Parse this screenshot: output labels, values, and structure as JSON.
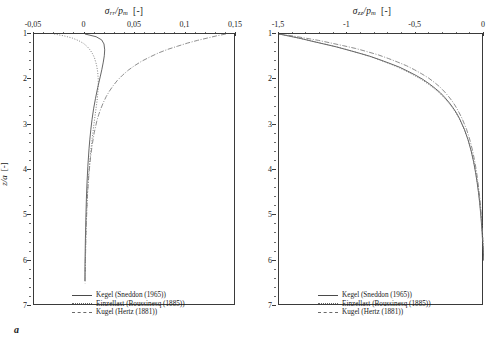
{
  "figure": {
    "panels": [
      {
        "letter": "a",
        "axis_title_symbol": "σ",
        "axis_title_sub": "rr",
        "axis_title_denom": "p",
        "axis_title_denom_sub": "m",
        "axis_title_unit": "[-]",
        "ylabel_symbol": "z/a",
        "ylabel_unit": "[-]",
        "xticks": [
          "-0,05",
          "0",
          "0,05",
          "0,1",
          "0,15"
        ],
        "yticks": [
          "1",
          "2",
          "3",
          "4",
          "5",
          "6",
          "7"
        ],
        "legend": [
          {
            "label": "Kegel (Sneddon (1965))",
            "style": "solid"
          },
          {
            "label": "Einzellast (Boussinesq (1885))",
            "style": "dotted"
          },
          {
            "label": "Kugel (Hertz (1881))",
            "style": "dashdot"
          }
        ]
      },
      {
        "letter": "b",
        "axis_title_symbol": "σ",
        "axis_title_sub": "zz",
        "axis_title_denom": "p",
        "axis_title_denom_sub": "m",
        "axis_title_unit": "[-]",
        "ylabel_symbol": "z/a",
        "ylabel_unit": "[-]",
        "xticks": [
          "-1,5",
          "-1",
          "-0,5",
          "0"
        ],
        "yticks": [
          "1",
          "2",
          "3",
          "4",
          "5",
          "6",
          "7"
        ],
        "legend": [
          {
            "label": "Kegel (Sneddon (1965))",
            "style": "solid"
          },
          {
            "label": "Einzellast (Boussinesq (1885))",
            "style": "dotted"
          },
          {
            "label": "Kugel (Hertz (1881))",
            "style": "dashdot"
          }
        ]
      }
    ]
  },
  "chart_data": [
    {
      "type": "line",
      "title": "",
      "xlabel": "σ_rr/p_m [-]",
      "ylabel": "z/a [-]",
      "xlim": [
        -0.05,
        0.15
      ],
      "ylim": [
        1,
        7
      ],
      "y_inverted": true,
      "xaxis_position": "top",
      "grid": false,
      "legend_position": "bottom-center",
      "series": [
        {
          "name": "Kegel (Sneddon (1965))",
          "style": "solid",
          "color": "#4a4a4a",
          "x": [
            0.0005,
            0.0115,
            0.017,
            0.0193,
            0.02,
            0.0196,
            0.0186,
            0.0172,
            0.0157,
            0.0131,
            0.0109,
            0.009,
            0.0075,
            0.0063,
            0.0053,
            0.0045,
            0.0033,
            0.0025,
            0.0019,
            0.0015,
            0.0012,
            0.0009,
            0.0007,
            0.0005,
            0.0004
          ],
          "y": [
            1.0,
            1.06,
            1.13,
            1.22,
            1.35,
            1.48,
            1.62,
            1.78,
            1.93,
            2.18,
            2.42,
            2.65,
            2.88,
            3.1,
            3.32,
            3.53,
            3.92,
            4.28,
            4.62,
            4.94,
            5.24,
            5.52,
            5.8,
            6.1,
            6.45
          ]
        },
        {
          "name": "Einzellast (Boussinesq (1885))",
          "style": "dotted",
          "color": "#6a6a6a",
          "x": [
            -0.03,
            -0.0205,
            -0.012,
            -0.0055,
            -0.0008,
            0.0028,
            0.0055,
            0.0078,
            0.0098,
            0.0119,
            0.0131,
            0.0136,
            0.0136,
            0.0131,
            0.0123,
            0.0112,
            0.0093,
            0.0076,
            0.0062,
            0.005,
            0.004,
            0.0032,
            0.0025,
            0.0019,
            0.0014,
            0.001,
            0.0007
          ],
          "y": [
            1.0,
            1.04,
            1.09,
            1.15,
            1.21,
            1.28,
            1.35,
            1.43,
            1.52,
            1.68,
            1.84,
            2.0,
            2.16,
            2.33,
            2.5,
            2.68,
            3.0,
            3.3,
            3.58,
            3.86,
            4.14,
            4.42,
            4.72,
            5.04,
            5.4,
            5.82,
            6.35
          ]
        },
        {
          "name": "Kugel (Hertz (1881))",
          "style": "dashdot",
          "color": "#7a7a7a",
          "x": [
            0.14,
            0.131,
            0.1215,
            0.112,
            0.102,
            0.092,
            0.0822,
            0.073,
            0.0645,
            0.0566,
            0.0495,
            0.0432,
            0.0376,
            0.0327,
            0.0284,
            0.0247,
            0.0215,
            0.0187,
            0.0163,
            0.0142,
            0.0124,
            0.0096,
            0.0076,
            0.006,
            0.0048,
            0.0038,
            0.003,
            0.0024,
            0.0018,
            0.0013,
            0.0009,
            0.0006
          ],
          "y": [
            1.0,
            1.04,
            1.09,
            1.14,
            1.2,
            1.27,
            1.34,
            1.42,
            1.51,
            1.6,
            1.7,
            1.8,
            1.91,
            2.02,
            2.14,
            2.26,
            2.38,
            2.51,
            2.64,
            2.77,
            2.9,
            3.18,
            3.45,
            3.72,
            3.99,
            4.26,
            4.54,
            4.84,
            5.18,
            5.56,
            6.0,
            6.5
          ]
        }
      ]
    },
    {
      "type": "line",
      "title": "",
      "xlabel": "σ_zz/p_m [-]",
      "ylabel": "z/a [-]",
      "xlim": [
        -1.5,
        0
      ],
      "ylim": [
        1,
        7
      ],
      "y_inverted": true,
      "xaxis_position": "top",
      "grid": false,
      "legend_position": "bottom-center",
      "series": [
        {
          "name": "Kegel (Sneddon (1965))",
          "style": "solid",
          "color": "#4a4a4a",
          "x": [
            -1.5,
            -1.42,
            -1.34,
            -1.258,
            -1.172,
            -1.086,
            -1.0,
            -0.916,
            -0.836,
            -0.76,
            -0.688,
            -0.62,
            -0.558,
            -0.5,
            -0.448,
            -0.4,
            -0.357,
            -0.318,
            -0.284,
            -0.253,
            -0.226,
            -0.202,
            -0.18,
            -0.144,
            -0.116,
            -0.094,
            -0.076,
            -0.062,
            -0.05,
            -0.04,
            -0.032,
            -0.025,
            -0.019,
            -0.014,
            -0.01,
            -0.006,
            -0.003,
            -0.001
          ],
          "y": [
            1.0,
            1.05,
            1.1,
            1.16,
            1.22,
            1.28,
            1.35,
            1.42,
            1.49,
            1.57,
            1.65,
            1.73,
            1.82,
            1.91,
            2.0,
            2.1,
            2.2,
            2.3,
            2.41,
            2.52,
            2.63,
            2.74,
            2.86,
            3.1,
            3.34,
            3.58,
            3.82,
            4.05,
            4.28,
            4.5,
            4.72,
            4.94,
            5.16,
            5.38,
            5.58,
            5.76,
            5.9,
            6.0
          ]
        },
        {
          "name": "Einzellast (Boussinesq (1885))",
          "style": "dotted",
          "color": "#6a6a6a",
          "x": [
            -1.5,
            -1.412,
            -1.325,
            -1.238,
            -1.152,
            -1.068,
            -0.986,
            -0.906,
            -0.83,
            -0.757,
            -0.688,
            -0.623,
            -0.562,
            -0.506,
            -0.454,
            -0.406,
            -0.362,
            -0.323,
            -0.288,
            -0.256,
            -0.228,
            -0.203,
            -0.181,
            -0.144,
            -0.115,
            -0.092,
            -0.074,
            -0.06,
            -0.048,
            -0.038,
            -0.03,
            -0.023,
            -0.017,
            -0.012,
            -0.008,
            -0.005,
            -0.002,
            -0.001
          ],
          "y": [
            1.0,
            1.05,
            1.11,
            1.17,
            1.23,
            1.29,
            1.36,
            1.43,
            1.5,
            1.58,
            1.66,
            1.74,
            1.83,
            1.92,
            2.01,
            2.11,
            2.21,
            2.31,
            2.42,
            2.53,
            2.64,
            2.75,
            2.87,
            3.11,
            3.35,
            3.59,
            3.83,
            4.06,
            4.29,
            4.51,
            4.73,
            4.95,
            5.17,
            5.39,
            5.59,
            5.77,
            5.91,
            6.0
          ]
        },
        {
          "name": "Kugel (Hertz (1881))",
          "style": "dashdot",
          "color": "#7a7a7a",
          "x": [
            -1.5,
            -1.405,
            -1.308,
            -1.212,
            -1.118,
            -1.026,
            -0.938,
            -0.854,
            -0.774,
            -0.7,
            -0.631,
            -0.567,
            -0.508,
            -0.455,
            -0.406,
            -0.362,
            -0.322,
            -0.287,
            -0.256,
            -0.228,
            -0.203,
            -0.181,
            -0.161,
            -0.128,
            -0.103,
            -0.083,
            -0.067,
            -0.054,
            -0.044,
            -0.035,
            -0.027,
            -0.021,
            -0.016,
            -0.011,
            -0.007,
            -0.004,
            -0.002,
            -0.001
          ],
          "y": [
            1.0,
            1.04,
            1.09,
            1.14,
            1.2,
            1.26,
            1.32,
            1.39,
            1.46,
            1.54,
            1.62,
            1.7,
            1.79,
            1.88,
            1.97,
            2.07,
            2.17,
            2.28,
            2.39,
            2.5,
            2.62,
            2.74,
            2.86,
            3.1,
            3.34,
            3.58,
            3.82,
            4.05,
            4.28,
            4.5,
            4.72,
            4.94,
            5.16,
            5.38,
            5.58,
            5.76,
            5.9,
            6.0
          ]
        }
      ]
    }
  ]
}
